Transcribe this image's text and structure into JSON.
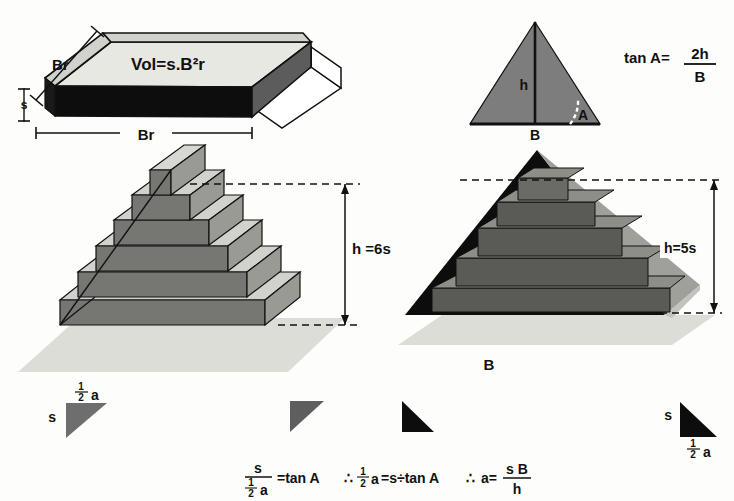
{
  "figure": {
    "title_visible": false,
    "background_color": "#fdfdfb",
    "palette": {
      "ink": "#111111",
      "black_face": "#0d0d0d",
      "dark_gray": "#595959",
      "mid_gray": "#6e6e6e",
      "step_gray": "#7a7a7a",
      "light_gray": "#c9c9c4",
      "pale_gray": "#d9d9d4",
      "top_face": "#e6e6e1",
      "ground": "#dedcd6",
      "white": "#ffffff"
    }
  },
  "slab": {
    "volume_label": "Vol=s.B²r",
    "depth_label": "Br",
    "width_label": "Br",
    "thickness_label": "s"
  },
  "triangle_panel": {
    "height_label": "h",
    "base_label": "B",
    "angle_label": "A",
    "formula": {
      "lead": "tan  A=",
      "numerator": "2h",
      "denominator": "B"
    }
  },
  "left_pyramid": {
    "height_label": "h =6s",
    "step_count": 6
  },
  "right_pyramid": {
    "height_label": "h=5s",
    "base_label": "B",
    "step_count": 5
  },
  "wedges": [
    {
      "name": "left-gray-wedge",
      "side_label": "s",
      "top_label": "½a_half",
      "half_num": "1",
      "half_den": "2",
      "half_var": "a",
      "color": "#6e6e6e",
      "label_position": "above"
    },
    {
      "name": "mid-gray-wedge",
      "side_label": "",
      "color": "#5e5e5e",
      "label_position": "none"
    },
    {
      "name": "mid-black-wedge",
      "side_label": "",
      "color": "#0d0d0d",
      "label_position": "none"
    },
    {
      "name": "right-black-wedge",
      "side_label": "s",
      "half_num": "1",
      "half_den": "2",
      "half_var": "a",
      "color": "#0d0d0d",
      "label_position": "below"
    }
  ],
  "bottom_formula": {
    "frac1_num": "s",
    "frac1_den_num": "1",
    "frac1_den_den": "2",
    "frac1_den_var": "a",
    "seg1": "=tan A",
    "therefore1": "∴",
    "seg2_num": "1",
    "seg2_den": "2",
    "seg2_var": "a",
    "seg3": "=s÷tan A",
    "therefore2": "∴",
    "seg4": "a=",
    "frac2_num": "s B",
    "frac2_den": "h"
  }
}
